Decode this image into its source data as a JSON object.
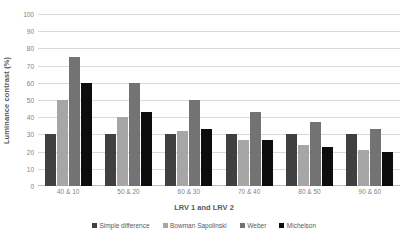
{
  "chart_data": {
    "type": "bar",
    "title": "",
    "xlabel": "LRV 1 and LRV 2",
    "ylabel": "Luminance contrast (%)",
    "ylim": [
      0,
      100
    ],
    "yticks": [
      0,
      10,
      20,
      30,
      40,
      50,
      60,
      70,
      80,
      90,
      100
    ],
    "grid": true,
    "legend_position": "bottom",
    "categories": [
      "40 & 10",
      "50 & 20",
      "60 & 30",
      "70 & 40",
      "80 & 50",
      "90 & 60"
    ],
    "series": [
      {
        "name": "Simple difference",
        "color": "#404040",
        "values": [
          30,
          30,
          30,
          30,
          30,
          30
        ]
      },
      {
        "name": "Bowman Sapolinski",
        "color": "#a6a6a6",
        "values": [
          50,
          40,
          32,
          27,
          24,
          21
        ]
      },
      {
        "name": "Weber",
        "color": "#737373",
        "values": [
          75,
          60,
          50,
          43,
          37,
          33
        ]
      },
      {
        "name": "Michelson",
        "color": "#0d0d0d",
        "values": [
          60,
          43,
          33,
          27,
          22.5,
          19.5
        ]
      }
    ]
  }
}
